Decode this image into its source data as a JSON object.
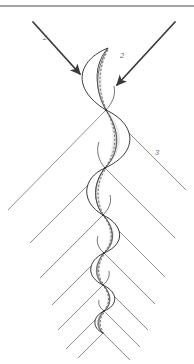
{
  "figure": {
    "background_color": "#ffffff",
    "width": 194,
    "height": 364,
    "ink_color": "#2b2b2b",
    "ray_color": "#7d7d7d",
    "label_color": "#6d6d6d",
    "shade_color": "#d8d8d8"
  },
  "frame": {
    "top_rule": {
      "x1": 0,
      "y1": 6,
      "x2": 194,
      "y2": 6,
      "color": "#4a4a4a"
    }
  },
  "labels": [
    {
      "id": "label-2-left",
      "text": "2",
      "x": 45,
      "y": 40
    },
    {
      "id": "label-2-right",
      "text": "2",
      "x": 122,
      "y": 58
    },
    {
      "id": "label-3",
      "text": "3",
      "x": 157,
      "y": 155
    }
  ],
  "arrows": [
    {
      "id": "arrow-left",
      "label": "2",
      "from_x": 33,
      "from_y": 22,
      "to_x": 84,
      "to_y": 78,
      "direction": "down-right"
    },
    {
      "id": "arrow-right",
      "label": "2",
      "from_x": 175,
      "from_y": 22,
      "to_x": 113,
      "to_y": 88,
      "direction": "down-left"
    }
  ],
  "nodes": [
    {
      "id": "node-1",
      "x": 106,
      "y": 110
    },
    {
      "id": "node-2",
      "x": 105,
      "y": 168
    },
    {
      "id": "node-3",
      "x": 103,
      "y": 215
    },
    {
      "id": "node-4",
      "x": 104,
      "y": 253
    },
    {
      "id": "node-5",
      "x": 103,
      "y": 285
    },
    {
      "id": "node-6",
      "x": 104,
      "y": 311
    },
    {
      "id": "node-7",
      "x": 103,
      "y": 333
    }
  ],
  "lenses": [
    {
      "id": "lens-1",
      "top_x": 108,
      "top_y": 48,
      "bot_x": 106,
      "bot_y": 110,
      "bulge": 30,
      "side": "left",
      "width": 30
    },
    {
      "id": "lens-2",
      "top_x": 106,
      "top_y": 110,
      "bot_x": 105,
      "bot_y": 168,
      "bulge": 28,
      "side": "right",
      "width": 28
    },
    {
      "id": "lens-3",
      "top_x": 105,
      "top_y": 168,
      "bot_x": 103,
      "bot_y": 215,
      "bulge": 22,
      "side": "left",
      "width": 22
    },
    {
      "id": "lens-4",
      "top_x": 103,
      "top_y": 215,
      "bot_x": 104,
      "bot_y": 253,
      "bulge": 18,
      "side": "right",
      "width": 18
    },
    {
      "id": "lens-5",
      "top_x": 104,
      "top_y": 253,
      "bot_x": 103,
      "bot_y": 285,
      "bulge": 14,
      "side": "left",
      "width": 14
    },
    {
      "id": "lens-6",
      "top_x": 103,
      "top_y": 285,
      "bot_x": 104,
      "bot_y": 311,
      "bulge": 11,
      "side": "right",
      "width": 11
    },
    {
      "id": "lens-7",
      "top_x": 104,
      "top_y": 311,
      "bot_x": 103,
      "bot_y": 333,
      "bulge": 8,
      "side": "left",
      "width": 8
    }
  ],
  "rays": {
    "count": 14,
    "description": "Straight rays radiating down-left and down-right from each node vertex",
    "left_family": [
      {
        "x1": 106,
        "y1": 110,
        "x2": 8,
        "y2": 210
      },
      {
        "x1": 105,
        "y1": 168,
        "x2": 30,
        "y2": 243
      },
      {
        "x1": 103,
        "y1": 215,
        "x2": 40,
        "y2": 278
      },
      {
        "x1": 104,
        "y1": 253,
        "x2": 52,
        "y2": 305
      },
      {
        "x1": 103,
        "y1": 285,
        "x2": 58,
        "y2": 330
      },
      {
        "x1": 104,
        "y1": 311,
        "x2": 66,
        "y2": 349
      },
      {
        "x1": 103,
        "y1": 333,
        "x2": 78,
        "y2": 358
      }
    ],
    "right_family": [
      {
        "x1": 106,
        "y1": 110,
        "x2": 186,
        "y2": 190
      },
      {
        "x1": 105,
        "y1": 168,
        "x2": 175,
        "y2": 238
      },
      {
        "x1": 103,
        "y1": 215,
        "x2": 165,
        "y2": 277
      },
      {
        "x1": 104,
        "y1": 253,
        "x2": 155,
        "y2": 304
      },
      {
        "x1": 103,
        "y1": 285,
        "x2": 148,
        "y2": 330
      },
      {
        "x1": 104,
        "y1": 311,
        "x2": 140,
        "y2": 347
      },
      {
        "x1": 103,
        "y1": 333,
        "x2": 130,
        "y2": 360
      }
    ]
  }
}
